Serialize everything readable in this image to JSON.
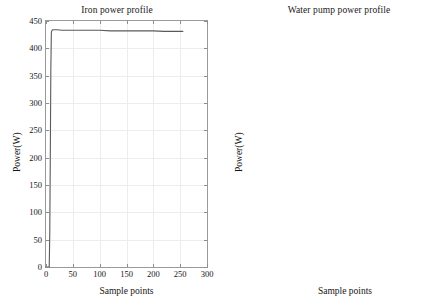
{
  "figure": {
    "background": "#ffffff",
    "line_color": "#5a5a5a",
    "axis_color": "#9a9a9a",
    "grid_color": "#ededed"
  },
  "chart_data": [
    {
      "type": "line",
      "title": "Iron power profile",
      "xlabel": "Sample points",
      "ylabel": "Power(W)",
      "xlim": [
        0,
        300
      ],
      "ylim": [
        0,
        450
      ],
      "xticks": [
        0,
        50,
        100,
        150,
        200,
        250,
        300
      ],
      "xticklabels": [
        "0",
        "50",
        "100",
        "150",
        "200",
        "250",
        "300"
      ],
      "yticks": [
        0,
        50,
        100,
        150,
        200,
        250,
        300,
        350,
        400,
        450
      ],
      "yticklabels": [
        "0",
        "50",
        "100",
        "150",
        "200",
        "250",
        "300",
        "350",
        "400",
        "450"
      ],
      "grid": true,
      "legend": null,
      "series": [
        {
          "name": "Iron power",
          "x": [
            0,
            6,
            7,
            8,
            9,
            10,
            12,
            15,
            20,
            30,
            45,
            60,
            80,
            100,
            120,
            140,
            160,
            180,
            200,
            220,
            240,
            250,
            255
          ],
          "y": [
            0,
            0,
            60,
            200,
            360,
            430,
            434,
            434,
            434,
            433,
            433,
            433,
            433,
            433,
            432,
            432,
            432,
            432,
            432,
            431,
            431,
            431,
            431
          ]
        }
      ]
    },
    {
      "type": "line",
      "title": "Water pump power profile",
      "xlabel": "Sample points",
      "ylabel": "Power(W)",
      "xlim": [
        0,
        300
      ],
      "ylim": [
        0,
        2000
      ],
      "xticks": [
        0,
        50,
        100,
        150,
        200,
        250,
        300
      ],
      "xticklabels": [
        "0",
        "50",
        "100",
        "150",
        "200",
        "250",
        "300"
      ],
      "yticks": [
        0,
        200,
        400,
        600,
        800,
        1000,
        1200,
        1400,
        1600,
        1800,
        2000
      ],
      "yticklabels": [
        "0",
        "200",
        "400",
        "600",
        "800",
        "1000",
        "1200",
        "1400",
        "1600",
        "1800",
        "2000"
      ],
      "grid": true,
      "legend": null,
      "series": [
        {
          "name": "Water pump power",
          "x": [
            0,
            5,
            6,
            7,
            8,
            9,
            10,
            11,
            12,
            13,
            14,
            15,
            16,
            17,
            18,
            20,
            22,
            25,
            30,
            40,
            60,
            80,
            100,
            120,
            140,
            160,
            175,
            185,
            195,
            205,
            215,
            225,
            235,
            245,
            253
          ],
          "y": [
            0,
            0,
            300,
            900,
            1500,
            1870,
            1950,
            1930,
            1830,
            1600,
            1300,
            1000,
            760,
            600,
            510,
            455,
            445,
            443,
            444,
            446,
            448,
            449,
            450,
            450,
            449,
            448,
            446,
            440,
            428,
            418,
            412,
            408,
            405,
            402,
            400
          ]
        }
      ]
    }
  ]
}
